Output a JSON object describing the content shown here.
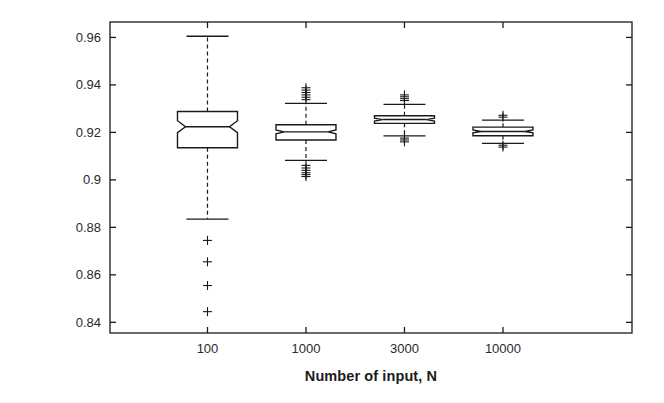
{
  "chart_data": {
    "type": "box",
    "title": "",
    "xlabel": "Number of input, N",
    "ylabel": "Broadcast reliability",
    "categories": [
      "100",
      "1000",
      "3000",
      "10000"
    ],
    "xtick_labels": [
      "100",
      "1000",
      "3000",
      "10000"
    ],
    "ytick_labels": [
      "0.96",
      "0.94",
      "0.92",
      "0.9",
      "0.88",
      "0.86",
      "0.84"
    ],
    "ytick_values": [
      0.96,
      0.94,
      0.92,
      0.9,
      0.88,
      0.86,
      0.84
    ],
    "ylim": [
      0.8355,
      0.9665
    ],
    "grid": false,
    "legend": null,
    "notched": true,
    "outlier_marker": "+",
    "box_fill": "#ffffff",
    "line_color": "#1a1a1a",
    "boxes": [
      {
        "category": "100",
        "whisker_low": 0.8835,
        "q1": 0.9135,
        "median": 0.9224,
        "q3": 0.9288,
        "whisker_high": 0.9605,
        "notch_low": 0.9199,
        "notch_high": 0.9249,
        "outliers": [
          0.8745,
          0.8655,
          0.8555,
          0.8445
        ]
      },
      {
        "category": "1000",
        "whisker_low": 0.9082,
        "q1": 0.9168,
        "median": 0.9202,
        "q3": 0.9232,
        "whisker_high": 0.9322,
        "notch_low": 0.9194,
        "notch_high": 0.921,
        "outliers": [
          0.9388,
          0.9378,
          0.9368,
          0.9358,
          0.9348,
          0.9338,
          0.9061,
          0.905,
          0.904,
          0.903,
          0.9022,
          0.9014
        ]
      },
      {
        "category": "3000",
        "whisker_low": 0.9185,
        "q1": 0.9238,
        "median": 0.9254,
        "q3": 0.927,
        "whisker_high": 0.9318,
        "notch_low": 0.9248,
        "notch_high": 0.926,
        "outliers": [
          0.9358,
          0.935,
          0.9342,
          0.9334,
          0.9176,
          0.9168,
          0.916
        ]
      },
      {
        "category": "10000",
        "whisker_low": 0.9154,
        "q1": 0.9186,
        "median": 0.9204,
        "q3": 0.9222,
        "whisker_high": 0.9252,
        "notch_low": 0.9198,
        "notch_high": 0.921,
        "outliers": [
          0.9272,
          0.9264,
          0.9146,
          0.9138
        ]
      }
    ]
  }
}
